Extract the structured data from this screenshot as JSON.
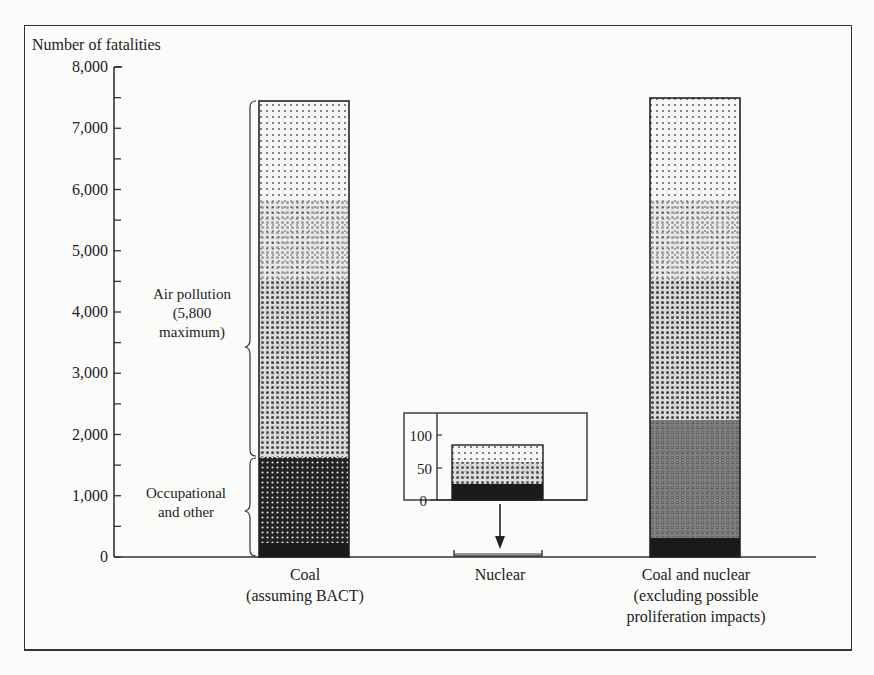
{
  "chart_data": {
    "type": "bar",
    "title": "",
    "ylabel": "Number of fatalities",
    "xlabel": "",
    "ylim": [
      0,
      8000
    ],
    "yticks": [
      "0",
      "1,000",
      "2,000",
      "3,000",
      "4,000",
      "5,000",
      "6,000",
      "7,000",
      "8,000"
    ],
    "yticks_values": [
      0,
      1000,
      2000,
      3000,
      4000,
      5000,
      6000,
      7000,
      8000
    ],
    "minor_ticks_every": 500,
    "grid": false,
    "legend": null,
    "categories": [
      [
        "Coal",
        "(assuming BACT)"
      ],
      [
        "Nuclear"
      ],
      [
        "Coal and nuclear",
        "(excluding possible",
        "proliferation impacts)"
      ]
    ],
    "series": [
      {
        "name": "Occupational and other",
        "values": [
          1630,
          0,
          0
        ]
      },
      {
        "name": "Air pollution",
        "values": [
          5815,
          0,
          0
        ]
      },
      {
        "name": "Total",
        "values": [
          7445,
          85,
          7490
        ]
      }
    ],
    "annotations": [
      {
        "text": [
          "Air pollution",
          "(5,800",
          "maximum)"
        ],
        "target": "Coal bar, 1,630 to 7,445"
      },
      {
        "text": [
          "Occupational",
          "and other"
        ],
        "target": "Coal bar, 0 to 1,630"
      }
    ],
    "inset": {
      "target": "Nuclear",
      "ylim": [
        0,
        120
      ],
      "yticks": [
        "0",
        "50",
        "100"
      ],
      "yticks_values": [
        0,
        50,
        100
      ],
      "value": 85
    }
  }
}
